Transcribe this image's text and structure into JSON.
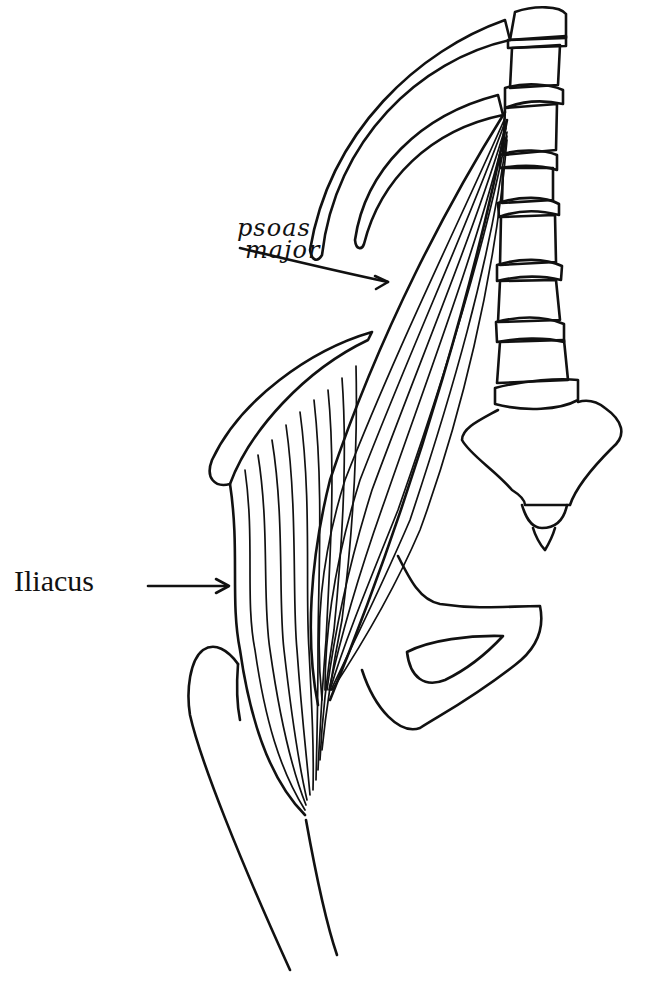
{
  "figure": {
    "background": "#ffffff",
    "ink_color": "#111111"
  },
  "labels": {
    "psoas_line1": "psoas",
    "psoas_line2": "major",
    "iliacus": "Iliacus"
  },
  "structures": [
    {
      "name": "lumbar-vertebral-column",
      "label": ""
    },
    {
      "name": "ribs",
      "label": ""
    },
    {
      "name": "sacrum-coccyx",
      "label": ""
    },
    {
      "name": "psoas-major-muscle",
      "label": "psoas major"
    },
    {
      "name": "iliacus-muscle",
      "label": "Iliacus"
    },
    {
      "name": "iliac-crest",
      "label": ""
    },
    {
      "name": "pubis-obturator-foramen",
      "label": ""
    },
    {
      "name": "femur",
      "label": ""
    }
  ],
  "arrows": [
    {
      "from": "psoas major",
      "to": "psoas-major-muscle"
    },
    {
      "from": "Iliacus",
      "to": "iliacus-muscle"
    }
  ]
}
